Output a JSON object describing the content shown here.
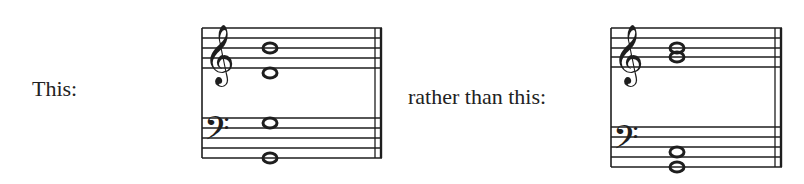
{
  "labels": {
    "first": "This:",
    "second": "rather than this:"
  },
  "examples": [
    {
      "name": "preferred",
      "description": "Grand staff, open spacing: treble B4 and E4 whole notes, bass E3 and G2 whole notes",
      "treble_notes": [
        "B4",
        "E4"
      ],
      "bass_notes": [
        "E3",
        "G2"
      ]
    },
    {
      "name": "avoided",
      "description": "Grand staff, close spacing: treble B4 and G4 whole notes, bass B2 and E2 whole notes",
      "treble_notes": [
        "B4",
        "G4"
      ],
      "bass_notes": [
        "B2",
        "E2"
      ]
    }
  ],
  "colors": {
    "ink": "#1e1e1e",
    "background": "#ffffff"
  }
}
